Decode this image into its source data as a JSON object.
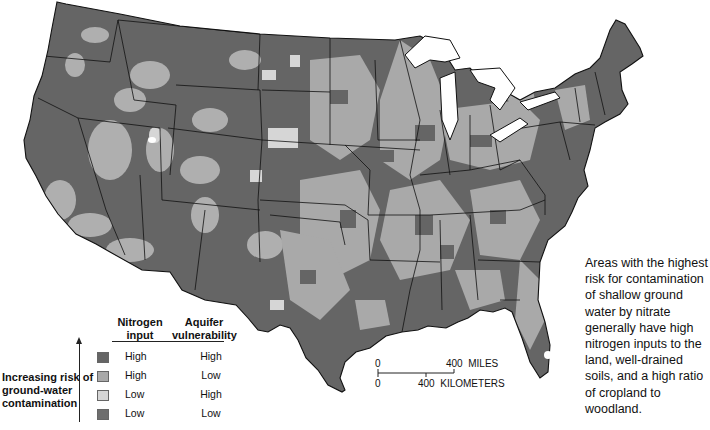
{
  "map": {
    "subject": "Risk of nitrate contamination of shallow ground water, conterminous United States",
    "colors": {
      "high_high": "#656565",
      "high_low": "#a9a9a9",
      "low_high": "#d6d6d6",
      "low_low": "#6e6e6e",
      "boundary": "#111111",
      "water": "#ffffff"
    }
  },
  "legend": {
    "col1_header_line1": "Nitrogen",
    "col1_header_line2": "input",
    "col2_header_line1": "Aquifer",
    "col2_header_line2": "vulnerability",
    "risk_label_line1": "Increasing risk of",
    "risk_label_line2": "ground-water",
    "risk_label_line3": "contamination",
    "rows": [
      {
        "nitrogen": "High",
        "aquifer": "High",
        "color": "#656565"
      },
      {
        "nitrogen": "High",
        "aquifer": "Low",
        "color": "#a9a9a9"
      },
      {
        "nitrogen": "Low",
        "aquifer": "High",
        "color": "#d6d6d6"
      },
      {
        "nitrogen": "Low",
        "aquifer": "Low",
        "color": "#6e6e6e"
      }
    ]
  },
  "scale_bar": {
    "miles_zero": "0",
    "miles_label": "400  MILES",
    "km_zero": "0",
    "km_label": "400  KILOMETERS"
  },
  "annotation": {
    "text": "Areas with the highest risk for contamination of shallow ground water by nitrate generally have high nitrogen inputs to the land, well-drained soils, and a high ratio of cropland to woodland."
  }
}
